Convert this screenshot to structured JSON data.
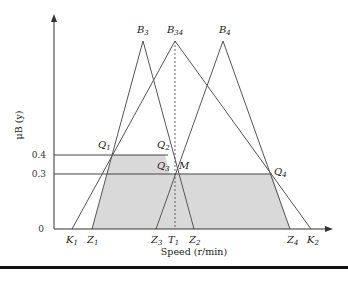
{
  "figure": {
    "type": "fuzzy-membership-diagram",
    "x_axis_label": "Speed (r/min)",
    "y_axis_label": "μB (y)",
    "y_ticks": [
      {
        "label": "0",
        "value": 0
      },
      {
        "label": "0.3",
        "value": 0.3
      },
      {
        "label": "0.4",
        "value": 0.4
      }
    ],
    "peaks": [
      {
        "id": "B3",
        "main": "B",
        "sub": "3"
      },
      {
        "id": "B34",
        "main": "B",
        "sub": "34"
      },
      {
        "id": "B4",
        "main": "B",
        "sub": "4"
      }
    ],
    "x_points": [
      {
        "id": "K1",
        "main": "K",
        "sub": "1"
      },
      {
        "id": "Z1",
        "main": "Z",
        "sub": "1"
      },
      {
        "id": "Z3",
        "main": "Z",
        "sub": "3"
      },
      {
        "id": "T1",
        "main": "T",
        "sub": "1"
      },
      {
        "id": "Z2",
        "main": "Z",
        "sub": "2"
      },
      {
        "id": "Z4",
        "main": "Z",
        "sub": "4"
      },
      {
        "id": "K2",
        "main": "K",
        "sub": "2"
      }
    ],
    "intersections": [
      {
        "id": "Q1",
        "main": "Q",
        "sub": "1"
      },
      {
        "id": "Q2",
        "main": "Q",
        "sub": "2"
      },
      {
        "id": "Q3",
        "main": "Q",
        "sub": "3"
      },
      {
        "id": "M",
        "main": "M",
        "sub": ""
      },
      {
        "id": "Q4",
        "main": "Q",
        "sub": "4"
      }
    ],
    "colors": {
      "line": "#555555",
      "shade": "#d9d9d9",
      "axis": "#333333"
    }
  }
}
